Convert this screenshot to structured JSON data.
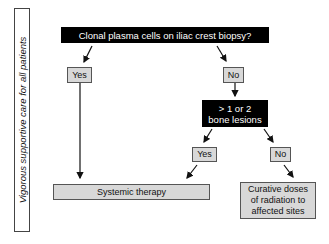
{
  "side_label": "Vigorous supportive care for all patients",
  "nodes": {
    "question1": "Clonal plasma cells on iliac crest biopsy?",
    "yes1": "Yes",
    "no1": "No",
    "question2_line1": "> 1 or 2",
    "question2_line2": "bone lesions",
    "yes2": "Yes",
    "no2": "No",
    "systemic": "Systemic therapy",
    "curative_line1": "Curative doses",
    "curative_line2": "of radiation to",
    "curative_line3": "affected sites"
  },
  "colors": {
    "question_bg": "#000000",
    "answer_bg": "#d8d8d8",
    "line": "#111111"
  }
}
